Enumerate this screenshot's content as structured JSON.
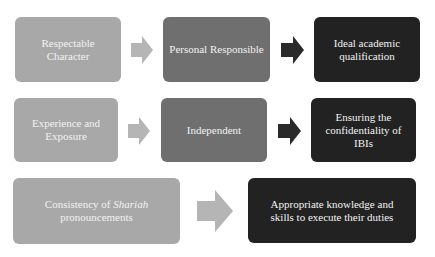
{
  "colors": {
    "light_box": "#a8a8a8",
    "mid_box": "#6f6f6f",
    "dark_box": "#222222",
    "light_arrow": "#b5b5b5",
    "dark_arrow": "#2a2a2a",
    "text": "#f2f2f2"
  },
  "rows": [
    {
      "boxes": [
        {
          "text": "Respectable Character"
        },
        {
          "text": "Personal Responsible"
        },
        {
          "text": "Ideal academic qualification"
        }
      ],
      "arrows": [
        "right-arrow-light",
        "right-arrow-dark"
      ]
    },
    {
      "boxes": [
        {
          "text": "Experience and Exposure"
        },
        {
          "text": "Independent"
        },
        {
          "text": "Ensuring the confidentiality of IBIs"
        }
      ],
      "arrows": [
        "right-arrow-light",
        "right-arrow-dark"
      ]
    },
    {
      "boxes": [
        {
          "text_before": "Consistency of ",
          "text_italic": "Shariah",
          "text_after": " pronouncements"
        },
        {
          "text": "Appropriate knowledge and skills to execute their duties"
        }
      ],
      "arrows": [
        "right-arrow-light"
      ]
    }
  ]
}
